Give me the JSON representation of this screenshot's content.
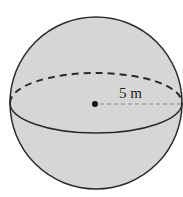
{
  "diagram": {
    "type": "sphere",
    "radius_label": "5 m",
    "fill_color": "#d4d4d4",
    "stroke_color": "#2a2a2a",
    "radius_line_color": "#8a8a8a"
  }
}
